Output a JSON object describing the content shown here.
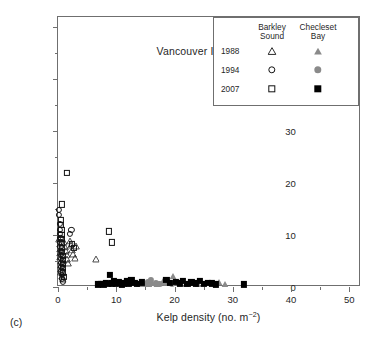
{
  "panel_letter": "(c)",
  "panel_title": "Vancouver Island",
  "legend": {
    "col_headers": [
      {
        "line1": "Barkley",
        "line2": "Sound"
      },
      {
        "line1": "Checleset",
        "line2": "Bay"
      }
    ],
    "rows": [
      {
        "year": "1988",
        "left_marker": "triangle-open",
        "right_marker": "triangle-filled-gray"
      },
      {
        "year": "1994",
        "left_marker": "circle-open",
        "right_marker": "circle-filled-gray"
      },
      {
        "year": "2007",
        "left_marker": "square-open",
        "right_marker": "square-filled-black"
      }
    ]
  },
  "colors": {
    "open_marker_edge": "#111111",
    "filled_black": "#000000",
    "filled_gray": "#8a8a8a",
    "axis": "#6f6f6f",
    "text": "#1f1f1f",
    "background": "#ffffff"
  },
  "chart_data": {
    "type": "scatter",
    "title": "Vancouver Island",
    "xlabel": "Kelp density (no. m-2)",
    "ylabel": "Sea urchin density (no. m-2)",
    "xlim": [
      0,
      52
    ],
    "ylim": [
      0,
      52
    ],
    "xticks": [
      0,
      10,
      20,
      30,
      40,
      50
    ],
    "yticks": [
      0,
      10,
      20,
      30,
      40,
      50
    ],
    "xminor_step": 5,
    "yminor_step": 5,
    "grid": false,
    "legend_position": "top-right",
    "series": [
      {
        "name": "Barkley Sound 1988",
        "marker": "triangle-open",
        "points": [
          [
            0.2,
            9.2
          ],
          [
            0.3,
            8.3
          ],
          [
            0.3,
            7.4
          ],
          [
            0.4,
            6.6
          ],
          [
            0.4,
            5.8
          ],
          [
            0.5,
            5.0
          ],
          [
            0.5,
            4.2
          ],
          [
            0.6,
            3.5
          ],
          [
            0.6,
            2.8
          ],
          [
            0.7,
            2.1
          ],
          [
            0.8,
            1.5
          ],
          [
            1.0,
            8.6
          ],
          [
            1.2,
            7.8
          ],
          [
            1.3,
            6.9
          ],
          [
            1.5,
            6.2
          ],
          [
            1.6,
            5.4
          ],
          [
            1.8,
            4.6
          ],
          [
            2.0,
            8.9
          ],
          [
            2.2,
            8.0
          ],
          [
            2.4,
            7.2
          ],
          [
            2.6,
            6.3
          ],
          [
            2.9,
            5.6
          ],
          [
            3.1,
            7.9
          ],
          [
            6.5,
            5.4
          ]
        ]
      },
      {
        "name": "Barkley Sound 1994",
        "marker": "circle-open",
        "points": [
          [
            0.2,
            14.9
          ],
          [
            0.2,
            13.9
          ],
          [
            0.3,
            12.1
          ],
          [
            0.3,
            11.0
          ],
          [
            0.3,
            10.2
          ],
          [
            0.4,
            9.4
          ],
          [
            0.4,
            8.6
          ],
          [
            0.4,
            7.8
          ],
          [
            0.5,
            7.0
          ],
          [
            0.5,
            6.2
          ],
          [
            0.5,
            5.4
          ],
          [
            0.6,
            4.6
          ],
          [
            0.6,
            3.8
          ],
          [
            0.6,
            3.0
          ],
          [
            0.7,
            2.3
          ],
          [
            0.7,
            1.6
          ],
          [
            0.8,
            1.0
          ],
          [
            2.0,
            10.3
          ],
          [
            2.3,
            11.0
          ]
        ]
      },
      {
        "name": "Barkley Sound 2007",
        "marker": "square-open",
        "points": [
          [
            1.5,
            21.9
          ],
          [
            0.7,
            15.9
          ],
          [
            0.5,
            12.9
          ],
          [
            0.5,
            11.9
          ],
          [
            0.6,
            11.0
          ],
          [
            0.6,
            10.1
          ],
          [
            0.6,
            9.3
          ],
          [
            0.7,
            8.5
          ],
          [
            0.7,
            7.6
          ],
          [
            0.7,
            6.8
          ],
          [
            0.8,
            6.0
          ],
          [
            0.8,
            5.2
          ],
          [
            0.8,
            4.4
          ],
          [
            0.9,
            3.6
          ],
          [
            0.9,
            2.8
          ],
          [
            1.0,
            2.0
          ],
          [
            2.4,
            8.3
          ],
          [
            2.7,
            7.5
          ],
          [
            8.8,
            10.7
          ],
          [
            9.3,
            8.6
          ]
        ]
      },
      {
        "name": "Checleset Bay 1988",
        "marker": "triangle-filled-gray",
        "points": [
          [
            13.9,
            0.6
          ],
          [
            15.0,
            0.5
          ],
          [
            15.6,
            0.5
          ],
          [
            16.2,
            0.7
          ],
          [
            17.0,
            0.6
          ],
          [
            18.1,
            1.2
          ],
          [
            19.0,
            0.8
          ],
          [
            19.8,
            2.1
          ],
          [
            20.4,
            1.0
          ],
          [
            22.0,
            0.6
          ],
          [
            24.0,
            0.5
          ],
          [
            26.0,
            0.7
          ],
          [
            27.6,
            0.9
          ],
          [
            28.6,
            0.6
          ]
        ]
      },
      {
        "name": "Checleset Bay 1994",
        "marker": "circle-filled-gray",
        "points": [
          [
            15.4,
            0.9
          ],
          [
            16.0,
            1.3
          ],
          [
            16.8,
            0.7
          ],
          [
            17.4,
            0.6
          ],
          [
            18.3,
            0.8
          ],
          [
            18.9,
            1.0
          ],
          [
            19.6,
            0.6
          ]
        ]
      },
      {
        "name": "Checleset Bay 2007",
        "marker": "square-filled-black",
        "points": [
          [
            6.9,
            0.5
          ],
          [
            7.4,
            0.6
          ],
          [
            7.8,
            0.5
          ],
          [
            8.2,
            0.8
          ],
          [
            8.6,
            0.6
          ],
          [
            8.9,
            2.4
          ],
          [
            9.2,
            0.7
          ],
          [
            9.6,
            1.2
          ],
          [
            10.0,
            0.6
          ],
          [
            10.4,
            0.9
          ],
          [
            10.9,
            0.5
          ],
          [
            11.3,
            0.7
          ],
          [
            11.8,
            1.1
          ],
          [
            12.2,
            0.6
          ],
          [
            12.6,
            1.3
          ],
          [
            13.1,
            0.8
          ],
          [
            13.5,
            0.6
          ],
          [
            14.4,
            0.9
          ],
          [
            18.6,
            1.4
          ],
          [
            19.2,
            0.8
          ],
          [
            20.2,
            1.0
          ],
          [
            20.9,
            0.7
          ],
          [
            21.5,
            1.2
          ],
          [
            22.2,
            0.6
          ],
          [
            22.9,
            0.9
          ],
          [
            23.6,
            0.7
          ],
          [
            24.3,
            1.1
          ],
          [
            25.0,
            0.6
          ],
          [
            25.7,
            0.8
          ],
          [
            26.4,
            0.7
          ],
          [
            27.1,
            0.5
          ],
          [
            31.9,
            0.5
          ]
        ]
      }
    ]
  }
}
